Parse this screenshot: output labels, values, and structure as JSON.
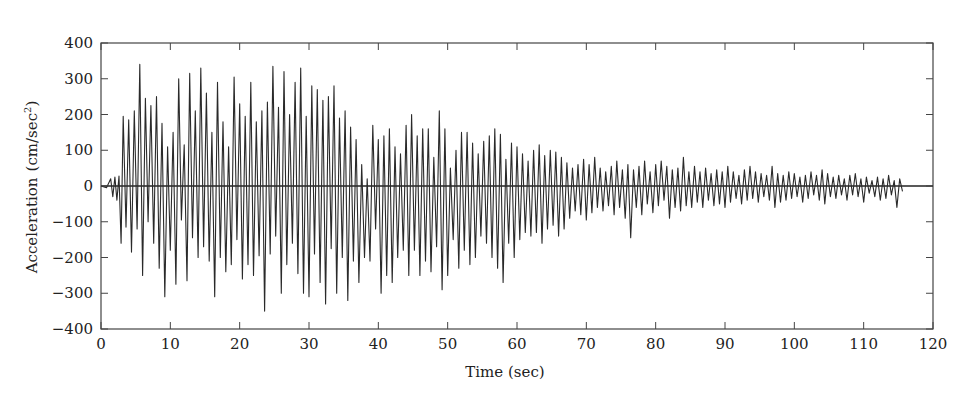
{
  "chart_data": {
    "type": "line",
    "title": "",
    "xlabel": "Time (sec)",
    "ylabel": "Acceleration (cm/sec²)",
    "ylabel_main": "Acceleration",
    "ylabel_unit": "(cm/sec",
    "ylabel_sup": "2",
    "ylabel_close": ")",
    "xlim": [
      0,
      120
    ],
    "ylim": [
      -400,
      400
    ],
    "xticks": [
      0,
      10,
      20,
      30,
      40,
      50,
      60,
      70,
      80,
      90,
      100,
      110,
      120
    ],
    "yticks": [
      400,
      300,
      200,
      100,
      0,
      -100,
      -200,
      -300,
      -400
    ],
    "ytick_labels": [
      "400",
      "300",
      "200",
      "100",
      "0",
      "−100",
      "−200",
      "−300",
      "−400"
    ],
    "grid": false,
    "legend": null,
    "zero_line": true,
    "line_color": "#2a2a2a",
    "series": [
      {
        "name": "Ground acceleration",
        "t": [
          0,
          0.8,
          1.4,
          1.7,
          2.0,
          2.3,
          2.6,
          2.9,
          3.2,
          3.6,
          4.0,
          4.4,
          4.8,
          5.2,
          5.6,
          6.0,
          6.4,
          6.8,
          7.2,
          7.6,
          8.0,
          8.4,
          8.8,
          9.2,
          9.6,
          10.0,
          10.4,
          10.8,
          11.2,
          11.6,
          12.0,
          12.4,
          12.8,
          13.2,
          13.6,
          14.0,
          14.4,
          14.8,
          15.2,
          15.6,
          16.0,
          16.4,
          16.8,
          17.2,
          17.6,
          18.0,
          18.4,
          18.8,
          19.2,
          19.6,
          20.0,
          20.4,
          20.8,
          21.2,
          21.6,
          22.0,
          22.4,
          22.8,
          23.2,
          23.6,
          24.0,
          24.4,
          24.8,
          25.2,
          25.6,
          26.0,
          26.4,
          26.8,
          27.2,
          27.6,
          28.0,
          28.4,
          28.8,
          29.2,
          29.6,
          30.0,
          30.4,
          30.8,
          31.2,
          31.6,
          32.0,
          32.4,
          32.8,
          33.2,
          33.6,
          34.0,
          34.4,
          34.8,
          35.2,
          35.6,
          36.0,
          36.4,
          36.8,
          37.2,
          37.6,
          38.0,
          38.4,
          38.8,
          39.2,
          39.6,
          40.0,
          40.4,
          40.8,
          41.2,
          41.6,
          42.0,
          42.4,
          42.8,
          43.2,
          43.6,
          44.0,
          44.4,
          44.8,
          45.2,
          45.6,
          46.0,
          46.4,
          46.8,
          47.2,
          47.6,
          48.0,
          48.4,
          48.8,
          49.2,
          49.6,
          50.0,
          50.4,
          50.8,
          51.2,
          51.6,
          52.0,
          52.4,
          52.8,
          53.2,
          53.6,
          54.0,
          54.4,
          54.8,
          55.2,
          55.6,
          56.0,
          56.4,
          56.8,
          57.2,
          57.6,
          58.0,
          58.4,
          58.8,
          59.2,
          59.6,
          60.0,
          60.4,
          60.8,
          61.2,
          61.6,
          62.0,
          62.4,
          62.8,
          63.2,
          63.6,
          64.0,
          64.4,
          64.8,
          65.2,
          65.6,
          66.0,
          66.4,
          66.8,
          67.2,
          67.6,
          68.0,
          68.4,
          68.8,
          69.2,
          69.6,
          70.0,
          70.4,
          70.8,
          71.2,
          71.6,
          72.0,
          72.4,
          72.8,
          73.2,
          73.6,
          74.0,
          74.4,
          74.8,
          75.2,
          75.6,
          76.0,
          76.4,
          76.8,
          77.2,
          77.6,
          78.0,
          78.4,
          78.8,
          79.2,
          79.6,
          80.0,
          80.4,
          80.8,
          81.2,
          81.6,
          82.0,
          82.4,
          82.8,
          83.2,
          83.6,
          84.0,
          84.4,
          84.8,
          85.2,
          85.6,
          86.0,
          86.4,
          86.8,
          87.2,
          87.6,
          88.0,
          88.4,
          88.8,
          89.2,
          89.6,
          90.0,
          90.4,
          90.8,
          91.2,
          91.6,
          92.0,
          92.4,
          92.8,
          93.2,
          93.6,
          94.0,
          94.4,
          94.8,
          95.2,
          95.6,
          96.0,
          96.4,
          96.8,
          97.2,
          97.6,
          98.0,
          98.4,
          98.8,
          99.2,
          99.6,
          100.0,
          100.4,
          100.8,
          101.2,
          101.6,
          102.0,
          102.4,
          102.8,
          103.2,
          103.6,
          104.0,
          104.4,
          104.8,
          105.2,
          105.6,
          106.0,
          106.4,
          106.8,
          107.2,
          107.6,
          108.0,
          108.4,
          108.8,
          109.2,
          109.6,
          110.0,
          110.4,
          110.8,
          111.2,
          111.6,
          112.0,
          112.4,
          112.8,
          113.2,
          113.6,
          114.0,
          114.4,
          114.8,
          115.2,
          115.6,
          116.0,
          116.4,
          116.8,
          117.2,
          117.6,
          118.0,
          118.4,
          118.8,
          119.2,
          119.6,
          120.0
        ],
        "a": [
          0,
          -5,
          20,
          -30,
          25,
          -40,
          28,
          -160,
          195,
          -115,
          185,
          -185,
          210,
          -120,
          340,
          -250,
          245,
          -100,
          225,
          -160,
          250,
          -230,
          175,
          -310,
          110,
          -180,
          150,
          -275,
          300,
          -95,
          115,
          -265,
          315,
          -145,
          210,
          -200,
          330,
          -170,
          260,
          -210,
          150,
          -310,
          290,
          -200,
          180,
          -240,
          110,
          -220,
          305,
          -150,
          230,
          -260,
          195,
          -220,
          290,
          -250,
          180,
          -195,
          210,
          -350,
          235,
          -190,
          335,
          -140,
          220,
          -300,
          320,
          -220,
          200,
          -160,
          290,
          -245,
          330,
          -300,
          195,
          -310,
          280,
          -190,
          270,
          -270,
          240,
          -330,
          250,
          -175,
          280,
          -300,
          190,
          -200,
          210,
          -320,
          165,
          -210,
          130,
          -270,
          60,
          -200,
          20,
          -210,
          170,
          -120,
          130,
          -300,
          140,
          -250,
          160,
          -270,
          110,
          -200,
          90,
          -180,
          170,
          -250,
          200,
          -180,
          140,
          -250,
          160,
          -210,
          160,
          -240,
          80,
          -170,
          210,
          -290,
          160,
          -250,
          50,
          -150,
          100,
          -230,
          150,
          -180,
          150,
          -220,
          120,
          -200,
          90,
          -140,
          125,
          -160,
          140,
          -200,
          160,
          -230,
          145,
          -270,
          75,
          -160,
          120,
          -200,
          110,
          -150,
          90,
          -130,
          70,
          -140,
          100,
          -130,
          115,
          -160,
          85,
          -120,
          100,
          -110,
          95,
          -140,
          80,
          -120,
          65,
          -90,
          50,
          -70,
          60,
          -80,
          75,
          -95,
          60,
          -75,
          80,
          -60,
          50,
          -70,
          40,
          -55,
          55,
          -80,
          70,
          -60,
          45,
          -90,
          60,
          -145,
          45,
          -60,
          55,
          -80,
          70,
          -50,
          40,
          -75,
          60,
          -55,
          70,
          -40,
          55,
          -90,
          45,
          -60,
          50,
          -70,
          80,
          -55,
          40,
          -60,
          55,
          -45,
          40,
          -60,
          50,
          -40,
          35,
          -55,
          45,
          -50,
          40,
          -60,
          55,
          -45,
          40,
          -35,
          30,
          -50,
          45,
          -40,
          55,
          -35,
          40,
          -45,
          35,
          -30,
          30,
          -40,
          55,
          -60,
          35,
          -45,
          30,
          -40,
          40,
          -35,
          35,
          -30,
          25,
          -45,
          30,
          -35,
          40,
          -25,
          30,
          -40,
          45,
          -50,
          35,
          -30,
          25,
          -35,
          30,
          -25,
          20,
          -40,
          30,
          -25,
          35,
          -30,
          20,
          -45,
          25,
          -20,
          15,
          -30,
          25,
          -40,
          20,
          -35,
          30,
          -25,
          15,
          -60,
          20,
          -15
        ]
      }
    ]
  }
}
